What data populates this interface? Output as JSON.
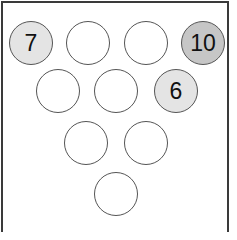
{
  "colors": {
    "frame": "#3a3a3a",
    "pin_stroke": "#555555",
    "pin_empty": "#ffffff",
    "pin_light": "#e4e4e4",
    "pin_dark": "#c6c6c6"
  },
  "pins": [
    {
      "row": 1,
      "label": "7",
      "fill": "#e4e4e4",
      "cx": 31,
      "cy": 43
    },
    {
      "row": 1,
      "label": "",
      "fill": "#ffffff",
      "cx": 88,
      "cy": 43
    },
    {
      "row": 1,
      "label": "",
      "fill": "#ffffff",
      "cx": 146,
      "cy": 43
    },
    {
      "row": 1,
      "label": "10",
      "fill": "#c6c6c6",
      "cx": 203,
      "cy": 43
    },
    {
      "row": 2,
      "label": "",
      "fill": "#ffffff",
      "cx": 58,
      "cy": 91
    },
    {
      "row": 2,
      "label": "",
      "fill": "#ffffff",
      "cx": 116,
      "cy": 91
    },
    {
      "row": 2,
      "label": "6",
      "fill": "#e4e4e4",
      "cx": 176,
      "cy": 91
    },
    {
      "row": 3,
      "label": "",
      "fill": "#ffffff",
      "cx": 86,
      "cy": 143
    },
    {
      "row": 3,
      "label": "",
      "fill": "#ffffff",
      "cx": 146,
      "cy": 143
    },
    {
      "row": 4,
      "label": "",
      "fill": "#ffffff",
      "cx": 116,
      "cy": 194
    }
  ]
}
